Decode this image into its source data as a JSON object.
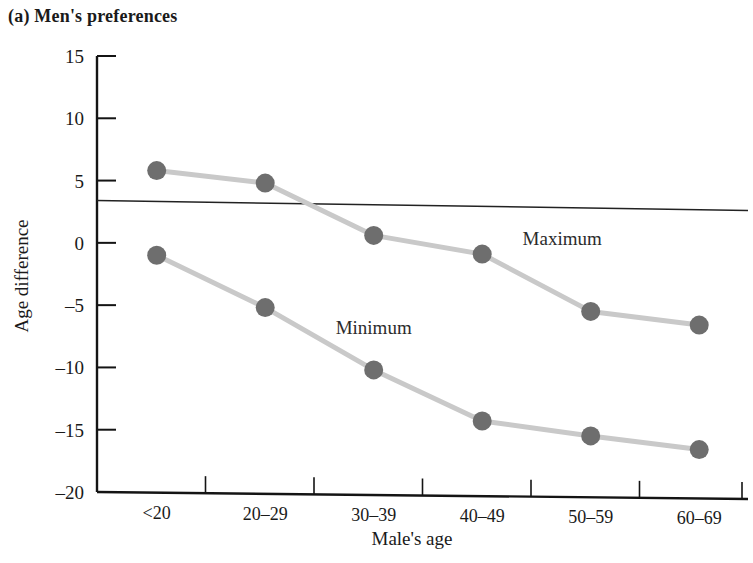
{
  "figure": {
    "panel_label": "(a) Men's preferences"
  },
  "chart_data": {
    "type": "line",
    "title": "(a) Men's preferences",
    "xlabel": "Male's age",
    "ylabel": "Age difference",
    "categories": [
      "<20",
      "20–29",
      "30–39",
      "40–49",
      "50–59",
      "60–69"
    ],
    "ylim": [
      -20,
      15
    ],
    "yticks": [
      15,
      10,
      5,
      0,
      -5,
      -10,
      -15,
      -20
    ],
    "ytick_labels": [
      "15",
      "10",
      "5",
      "0",
      "–5",
      "–10",
      "–15",
      "–20"
    ],
    "grid": false,
    "legend": "inline-annotations",
    "series": [
      {
        "name": "Maximum",
        "label": "Maximum",
        "color": "#6e6e6e",
        "line_color": "#c9c9c9",
        "values": [
          5.8,
          4.8,
          0.6,
          -0.9,
          -5.5,
          -6.6
        ],
        "annotation": {
          "text": "Maximum",
          "category": "40–49",
          "value": -0.2
        }
      },
      {
        "name": "Minimum",
        "label": "Minimum",
        "color": "#6e6e6e",
        "line_color": "#c9c9c9",
        "values": [
          -1.0,
          -5.2,
          -10.2,
          -14.3,
          -15.5,
          -16.6
        ],
        "annotation": {
          "text": "Minimum",
          "category": "30–39",
          "value": -7.3
        }
      }
    ],
    "reference_line": {
      "name": "own-age reference",
      "value_left": 3.4,
      "value_right": 2.6,
      "color": "#222222"
    }
  }
}
